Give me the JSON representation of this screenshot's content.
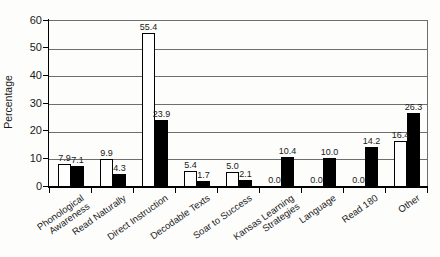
{
  "chart_data": {
    "type": "bar",
    "title": "",
    "xlabel": "",
    "ylabel": "Percentage",
    "ylim": [
      0,
      60
    ],
    "yticks": [
      0,
      10,
      20,
      30,
      40,
      50,
      60
    ],
    "grid": true,
    "legend": null,
    "categories": [
      "Phonological\nAwareness",
      "Read Naturally",
      "Direct Instruction",
      "Decodable Texts",
      "Soar to Success",
      "Kansas Learning\nStrategies",
      "Language",
      "Read 180",
      "Other"
    ],
    "series": [
      {
        "name": "white-bars",
        "fill": "#ffffff",
        "values": [
          7.9,
          9.9,
          55.4,
          5.4,
          5.0,
          0.0,
          0.0,
          0.0,
          16.4
        ]
      },
      {
        "name": "black-bars",
        "fill": "#000000",
        "values": [
          7.1,
          4.3,
          23.9,
          1.7,
          2.1,
          10.4,
          10.0,
          14.2,
          26.3
        ]
      }
    ],
    "value_label_decimals": 1
  },
  "colors": {
    "axis": "#000000",
    "gridline": "#6e6e6e",
    "text": "#1a1a1a",
    "background": "#fdfdfc"
  }
}
